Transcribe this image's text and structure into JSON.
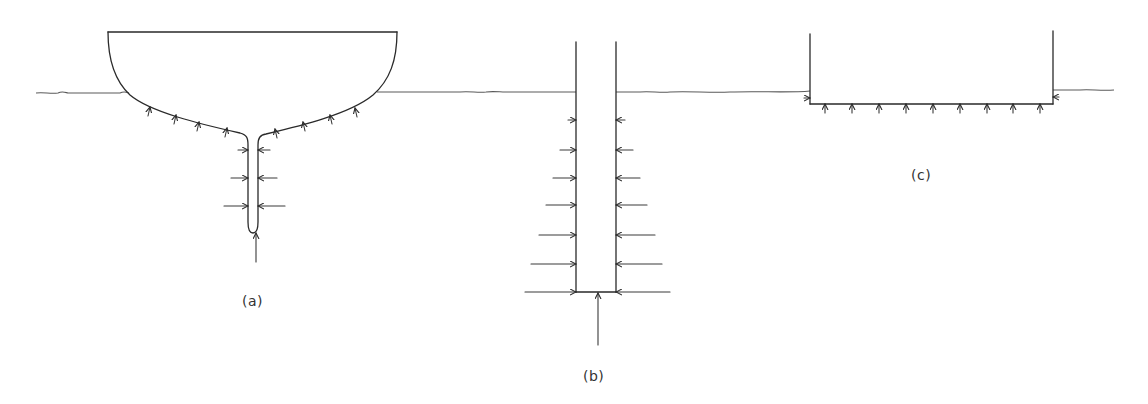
{
  "figure": {
    "colors": {
      "line": "#2a2a2a",
      "water": "#5a5a5a",
      "label": "#333333",
      "background": "#ffffff"
    },
    "panels": [
      {
        "id": "a",
        "label": "(a)",
        "shape": "yacht hull with deep fin keel",
        "hull_normal_arrows_left": 4,
        "hull_normal_arrows_right": 4,
        "keel_horizontal_arrow_pairs": 3,
        "keel_bottom_arrow": 1
      },
      {
        "id": "b",
        "label": "(b)",
        "shape": "vertical pile / column",
        "horizontal_arrow_pairs": 7,
        "bottom_arrow": 1
      },
      {
        "id": "c",
        "label": "(c)",
        "shape": "rectangular box / pontoon",
        "bottom_arrows": 9,
        "corner_arrows": 2
      }
    ]
  }
}
